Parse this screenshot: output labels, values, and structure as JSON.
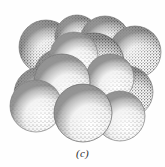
{
  "figure": {
    "caption": "(c)",
    "rendering_style": "stipple-shaded line drawing",
    "background_color": "#fefefe",
    "ink_color": "#1a1a1a",
    "sphere_count": 14,
    "illustration_width": 165,
    "illustration_height": 148
  },
  "chart_data": {
    "type": "scatter",
    "title": "",
    "xlabel": "",
    "ylabel": "",
    "xlim": [
      0,
      165
    ],
    "ylim": [
      0,
      148
    ],
    "grid": false,
    "legend": "none",
    "annotations": [
      "(c)"
    ],
    "series": [
      {
        "name": "back-layer-spheres",
        "shade": "mid",
        "points": [
          {
            "id": "b1",
            "x": 46,
            "y": 47,
            "r": 27,
            "hx": 38,
            "hy": 38
          },
          {
            "id": "b2",
            "x": 105,
            "y": 41,
            "r": 25,
            "hx": 98,
            "hy": 32
          },
          {
            "id": "b3",
            "x": 135,
            "y": 52,
            "r": 26,
            "hx": 128,
            "hy": 43
          },
          {
            "id": "b4",
            "x": 77,
            "y": 37,
            "r": 22,
            "hx": 70,
            "hy": 29
          }
        ]
      },
      {
        "name": "middle-layer-spheres",
        "shade": "dark",
        "points": [
          {
            "id": "m1",
            "x": 94,
            "y": 63,
            "r": 30,
            "hx": 85,
            "hy": 52
          },
          {
            "id": "m2",
            "x": 41,
            "y": 94,
            "r": 27,
            "hx": 33,
            "hy": 84
          },
          {
            "id": "m3",
            "x": 127,
            "y": 92,
            "r": 26,
            "hx": 119,
            "hy": 82
          },
          {
            "id": "m4",
            "x": 60,
            "y": 75,
            "r": 26,
            "hx": 52,
            "hy": 65
          }
        ]
      },
      {
        "name": "front-layer-spheres",
        "shade": "light",
        "points": [
          {
            "id": "f1",
            "x": 62,
            "y": 82,
            "r": 28,
            "hx": 54,
            "hy": 71
          },
          {
            "id": "f2",
            "x": 83,
            "y": 113,
            "r": 29,
            "hx": 75,
            "hy": 102
          },
          {
            "id": "f3",
            "x": 120,
            "y": 116,
            "r": 25,
            "hx": 112,
            "hy": 106
          },
          {
            "id": "f4",
            "x": 36,
            "y": 106,
            "r": 26,
            "hx": 28,
            "hy": 96
          },
          {
            "id": "f5",
            "x": 110,
            "y": 78,
            "r": 24,
            "hx": 103,
            "hy": 69
          },
          {
            "id": "f6",
            "x": 74,
            "y": 56,
            "r": 24,
            "hx": 67,
            "hy": 47
          }
        ]
      }
    ]
  }
}
